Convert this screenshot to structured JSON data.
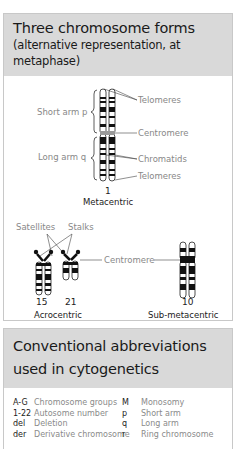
{
  "section1": {
    "title": "Three chromosome forms",
    "subtitle_line1": "(alternative representation, at",
    "subtitle_line2": "metaphase)",
    "metacentric": {
      "labels": {
        "short_arm": "Short arm p",
        "long_arm": "Long arm q",
        "telomeres_top": "Telomeres",
        "centromere": "Centromere",
        "chromatids": "Chromatids",
        "telomeres_bottom": "Telomeres"
      },
      "number": "1",
      "caption": "Metacentric"
    },
    "acrocentric": {
      "labels": {
        "satellites": "Satellites",
        "stalks": "Stalks"
      },
      "numbers": [
        "15",
        "21"
      ],
      "caption": "Acrocentric"
    },
    "centromere_label": "Centromere",
    "submetacentric": {
      "number": "10",
      "caption": "Sub-metacentric"
    }
  },
  "section2": {
    "title_line1": "Conventional abbreviations",
    "title_line2": "used in cytogenetics",
    "rows": [
      {
        "k1": "A-G",
        "v1": "Chromosome groups",
        "k2": "M",
        "v2": "Monosomy"
      },
      {
        "k1": "1-22",
        "v1": "Autosome number",
        "k2": "p",
        "v2": "Short arm"
      },
      {
        "k1": "del",
        "v1": "Deletion",
        "k2": "q",
        "v2": "Long arm"
      },
      {
        "k1": "der",
        "v1": "Derivative chromosome",
        "k2": "r",
        "v2": "Ring chromosome"
      }
    ]
  }
}
